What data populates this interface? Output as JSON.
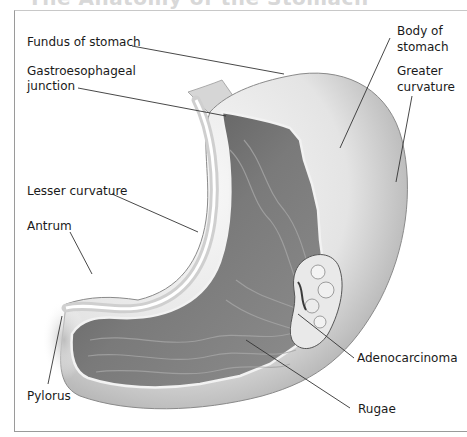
{
  "figure": {
    "title": "The Anatomy of the Stomach",
    "labels": {
      "fundus": "Fundus of stomach",
      "ge_junction_1": "Gastroesophageal",
      "ge_junction_2": "junction",
      "body_1": "Body of",
      "body_2": "stomach",
      "greater_1": "Greater",
      "greater_2": "curvature",
      "lesser": "Lesser curvature",
      "antrum": "Antrum",
      "adenocarcinoma": "Adenocarcinoma",
      "pylorus": "Pylorus",
      "rugae": "Rugae"
    }
  },
  "colors": {
    "outer_wall": "#e6e6e6",
    "mucosa_dark": "#6a6a6a",
    "mucosa_mid": "#8c8c8c",
    "leader_line": "#333333",
    "frame": "#9a9a9a"
  }
}
